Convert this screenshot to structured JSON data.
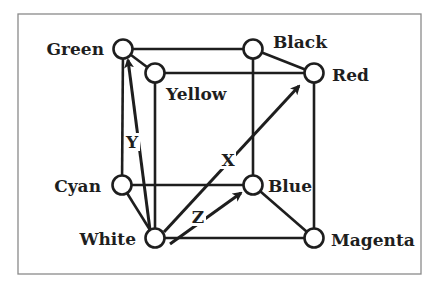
{
  "diagram": {
    "type": "rgb-color-cube",
    "frame": {
      "x": 18,
      "y": 14,
      "width": 403,
      "height": 260,
      "stroke": "#8a8a8a"
    },
    "colors": {
      "line": "#1e1e1e",
      "node_fill": "#ffffff",
      "background": "#ffffff"
    },
    "nodes": [
      {
        "id": "green",
        "label": "Green",
        "x": 123,
        "y": 49,
        "label_x": 104,
        "label_y": 55,
        "anchor": "end"
      },
      {
        "id": "yellow",
        "label": "Yellow",
        "x": 155,
        "y": 73,
        "label_x": 166,
        "label_y": 100,
        "anchor": "start"
      },
      {
        "id": "black",
        "label": "Black",
        "x": 253,
        "y": 49,
        "label_x": 273,
        "label_y": 48,
        "anchor": "start"
      },
      {
        "id": "red",
        "label": "Red",
        "x": 314,
        "y": 73,
        "label_x": 332,
        "label_y": 81,
        "anchor": "start"
      },
      {
        "id": "cyan",
        "label": "Cyan",
        "x": 122,
        "y": 185,
        "label_x": 101,
        "label_y": 192,
        "anchor": "end"
      },
      {
        "id": "blue",
        "label": "Blue",
        "x": 253,
        "y": 185,
        "label_x": 268,
        "label_y": 192,
        "anchor": "start"
      },
      {
        "id": "white",
        "label": "White",
        "x": 155,
        "y": 238,
        "label_x": 136,
        "label_y": 245,
        "anchor": "end"
      },
      {
        "id": "magenta",
        "label": "Magenta",
        "x": 314,
        "y": 238,
        "label_x": 331,
        "label_y": 246,
        "anchor": "start"
      }
    ],
    "edges": [
      [
        "green",
        "black"
      ],
      [
        "green",
        "yellow"
      ],
      [
        "green",
        "cyan"
      ],
      [
        "yellow",
        "red"
      ],
      [
        "yellow",
        "white"
      ],
      [
        "black",
        "red"
      ],
      [
        "black",
        "blue"
      ],
      [
        "red",
        "magenta"
      ],
      [
        "cyan",
        "blue"
      ],
      [
        "cyan",
        "white"
      ],
      [
        "blue",
        "magenta"
      ],
      [
        "white",
        "magenta"
      ]
    ],
    "axes": [
      {
        "id": "x",
        "label": "X",
        "from": [
          164,
          232
        ],
        "to": [
          299,
          86
        ],
        "label_x": 228,
        "label_y": 166
      },
      {
        "id": "y",
        "label": "Y",
        "from": [
          150,
          230
        ],
        "to": [
          128,
          60
        ],
        "label_x": 132,
        "label_y": 148
      },
      {
        "id": "z",
        "label": "Z",
        "from": [
          170,
          244
        ],
        "to": [
          241,
          193
        ],
        "label_x": 198,
        "label_y": 223
      }
    ]
  }
}
